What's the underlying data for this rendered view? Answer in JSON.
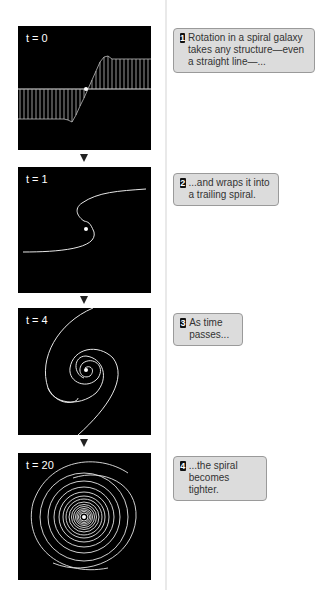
{
  "panels": [
    {
      "time_var": "t",
      "time_value": "0",
      "label": "t = 0"
    },
    {
      "time_var": "t",
      "time_value": "1",
      "label": "t = 1"
    },
    {
      "time_var": "t",
      "time_value": "4",
      "label": "t = 4"
    },
    {
      "time_var": "t",
      "time_value": "20",
      "label": "t = 20"
    }
  ],
  "callouts": [
    {
      "number": "1",
      "text": "Rotation in a spiral galaxy takes any structure—even a straight line—..."
    },
    {
      "number": "2",
      "text": "...and wraps it into a trailing spiral."
    },
    {
      "number": "3",
      "text": "As time passes..."
    },
    {
      "number": "4",
      "text": "...the spiral becomes tighter."
    }
  ],
  "colors": {
    "panel_bg": "#000000",
    "line": "#e6e6e6",
    "callout_bg": "#dcdcdc",
    "callout_border": "#9a9a9a",
    "arrow": "#222222"
  }
}
